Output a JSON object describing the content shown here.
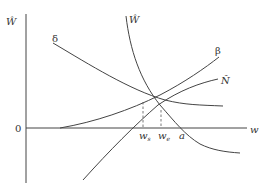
{
  "diagram": {
    "axes": {
      "y_label": "Ŵ",
      "x_label": "w",
      "origin_label": "0"
    },
    "curves": {
      "delta": "δ",
      "beta": "β",
      "w_hat": "Ŵ",
      "n_hat": "N̂"
    },
    "markers": {
      "w_s": "w",
      "w_s_sub": "s",
      "w_e": "w",
      "w_e_sub": "e",
      "a": "a"
    },
    "colors": {
      "line": "#444444",
      "background": "#ffffff"
    }
  }
}
